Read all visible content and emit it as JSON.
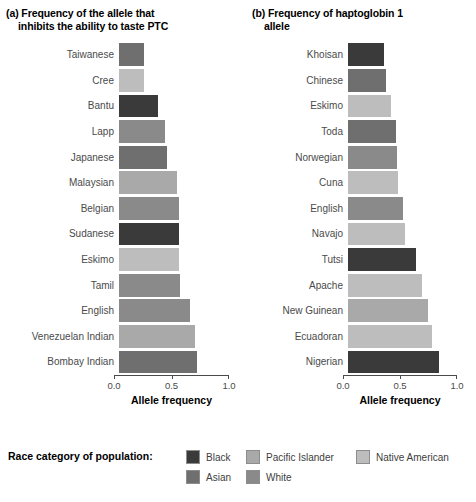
{
  "chart_data": [
    {
      "type": "bar",
      "panel": "a",
      "title_line1": "(a) Frequency of the allele that",
      "title_line2": "inhibits the ability to taste PTC",
      "xlabel": "Allele frequency",
      "ylabel": "",
      "xlim": [
        0.0,
        1.0
      ],
      "xticks": [
        "0.0",
        "0.5",
        "1.0"
      ],
      "xtick_values": [
        0.0,
        0.5,
        1.0
      ],
      "grid": false,
      "orientation": "horizontal",
      "legend_position": "bottom",
      "categories": [
        "Taiwanese",
        "Cree",
        "Bantu",
        "Lapp",
        "Japanese",
        "Malaysian",
        "Belgian",
        "Sudanese",
        "Eskimo",
        "Tamil",
        "English",
        "Venezuelan Indian",
        "Bombay Indian"
      ],
      "values": [
        0.22,
        0.22,
        0.34,
        0.4,
        0.42,
        0.5,
        0.52,
        0.52,
        0.52,
        0.53,
        0.62,
        0.66,
        0.68
      ],
      "race_categories": [
        "Asian",
        "Native American",
        "Black",
        "White",
        "Asian",
        "Pacific Islander",
        "White",
        "Black",
        "Native American",
        "White",
        "White",
        "Pacific Islander",
        "Asian"
      ]
    },
    {
      "type": "bar",
      "panel": "b",
      "title_line1": "(b) Frequency of haptoglobin 1",
      "title_line2": "allele",
      "xlabel": "Allele frequency",
      "ylabel": "",
      "xlim": [
        0.0,
        1.0
      ],
      "xticks": [
        "0.0",
        "0.5",
        "1.0"
      ],
      "xtick_values": [
        0.0,
        0.5,
        1.0
      ],
      "grid": false,
      "orientation": "horizontal",
      "legend_position": "bottom",
      "categories": [
        "Khoisan",
        "Chinese",
        "Eskimo",
        "Toda",
        "Norwegian",
        "Cuna",
        "English",
        "Navajo",
        "Tutsi",
        "Apache",
        "New Guinean",
        "Ecuadoran",
        "Nigerian"
      ],
      "values": [
        0.32,
        0.33,
        0.38,
        0.42,
        0.43,
        0.44,
        0.48,
        0.5,
        0.6,
        0.65,
        0.7,
        0.74,
        0.8
      ],
      "race_categories": [
        "Black",
        "Asian",
        "Native American",
        "Asian",
        "White",
        "Native American",
        "White",
        "Native American",
        "Black",
        "Native American",
        "Pacific Islander",
        "Native American",
        "Black"
      ]
    }
  ],
  "legend": {
    "title": "Race category of population:",
    "items": [
      {
        "label": "Black",
        "color": "#3a3a3a"
      },
      {
        "label": "Asian",
        "color": "#6f6f6f"
      },
      {
        "label": "Pacific Islander",
        "color": "#a9a9a9"
      },
      {
        "label": "White",
        "color": "#8a8a8a"
      },
      {
        "label": "Native American",
        "color": "#bdbdbd"
      }
    ]
  },
  "palette": {
    "Black": "#3a3a3a",
    "Asian": "#6f6f6f",
    "Pacific Islander": "#a9a9a9",
    "White": "#8a8a8a",
    "Native American": "#bdbdbd"
  }
}
